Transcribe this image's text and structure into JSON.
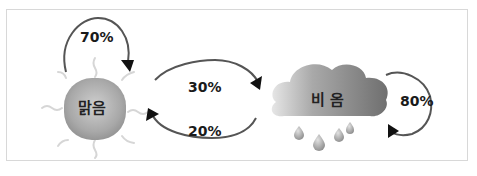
{
  "diagram": {
    "type": "markov-weather-transition",
    "states": [
      {
        "id": "sunny",
        "label": "맑음",
        "icon": "sun-icon"
      },
      {
        "id": "rainy",
        "label": "비 옴",
        "icon": "rain-cloud-icon"
      }
    ],
    "transitions": [
      {
        "from": "sunny",
        "to": "sunny",
        "label": "70%"
      },
      {
        "from": "sunny",
        "to": "rainy",
        "label": "30%"
      },
      {
        "from": "rainy",
        "to": "sunny",
        "label": "20%"
      },
      {
        "from": "rainy",
        "to": "rainy",
        "label": "80%"
      }
    ],
    "colors": {
      "arrow": "#555555",
      "arrowhead": "#111111",
      "border": "#d8d8d8",
      "sun_fill": "#a9a9a9",
      "cloud_fill": "#8a8a8a",
      "ray": "#d6d6d6"
    }
  }
}
